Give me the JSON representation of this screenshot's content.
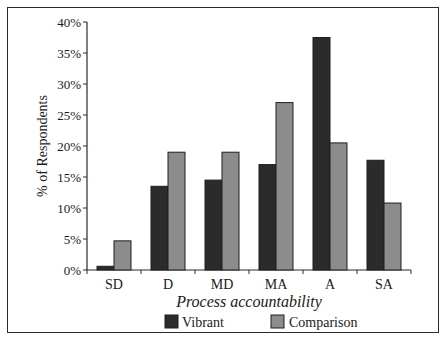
{
  "colors": {
    "vibrant": "#2b2b2b",
    "comparison": "#8c8c8c",
    "axis": "#2a2a2a",
    "bar_stroke": "#1f1f1f"
  },
  "chart_data": {
    "type": "bar",
    "title": "",
    "xlabel": "Process accountability",
    "ylabel": "% of Respondents",
    "categories": [
      "SD",
      "D",
      "MD",
      "MA",
      "A",
      "SA"
    ],
    "series": [
      {
        "name": "Vibrant",
        "values": [
          0.6,
          13.5,
          14.5,
          17.0,
          37.5,
          17.7
        ]
      },
      {
        "name": "Comparison",
        "values": [
          4.7,
          19.0,
          19.0,
          27.0,
          20.5,
          10.8
        ]
      }
    ],
    "ylim": [
      0,
      40
    ],
    "yticks": [
      "0%",
      "5%",
      "10%",
      "15%",
      "20%",
      "25%",
      "30%",
      "35%",
      "40%"
    ],
    "grid": false,
    "legend_position": "bottom",
    "legend": [
      "Vibrant",
      "Comparison"
    ]
  }
}
